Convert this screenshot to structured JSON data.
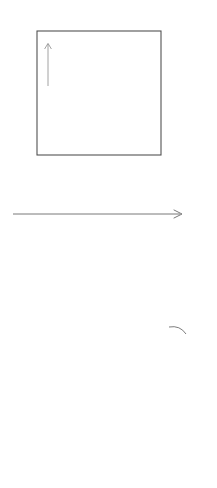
{
  "figure": {
    "title_visible": false,
    "background_color": "#ffffff",
    "ink_color": "#555555",
    "guide_color": "#d8d8d8",
    "curve_color": "#4a4a4a",
    "cobweb_color": "#777777"
  },
  "labels": {
    "identity_top": "id",
    "identity_bottom": "id",
    "function_top": "f",
    "function_bottom_base": "f",
    "function_bottom_exponent": "2"
  },
  "axis": {
    "name": "x-axis",
    "arrow": "right-arrow",
    "ticks": [
      {
        "id": "a0",
        "base": "a",
        "sub": "0",
        "x": 37,
        "label_x": 33,
        "label_y": 219
      },
      {
        "id": "x4",
        "base": "x",
        "sub": "4",
        "x": 76,
        "label_x": 69,
        "label_y": 232
      },
      {
        "id": "x2",
        "base": "x",
        "sub": "2",
        "x": 85,
        "label_x": 79,
        "label_y": 226
      },
      {
        "id": "x0",
        "base": "x",
        "sub": "0",
        "x": 93,
        "label_x": 88,
        "label_y": 219
      },
      {
        "id": "x1",
        "base": "x",
        "sub": "1",
        "x": 124,
        "label_x": 118,
        "label_y": 232
      },
      {
        "id": "x3",
        "base": "x",
        "sub": "3",
        "x": 131,
        "label_x": 126,
        "label_y": 226
      },
      {
        "id": "x5",
        "base": "x",
        "sub": "5",
        "x": 140,
        "label_x": 135,
        "label_y": 219
      },
      {
        "id": "a1",
        "base": "a",
        "sub": "1",
        "x": 161,
        "label_x": 155,
        "label_y": 219
      }
    ]
  },
  "chart_data": {
    "type": "line",
    "panels": [
      {
        "name": "top-panel-f",
        "description": "Graph of orientation-reversing map f with identity diagonal and inward spiralling cobweb inside the invariant box [a0,a1]x[a0,a1]",
        "xlabel": "",
        "ylabel": "",
        "box": {
          "x0": 37,
          "y0": 31,
          "x1": 161,
          "y1": 155
        },
        "legend": [
          "id",
          "f"
        ],
        "curves": [
          {
            "name": "identity",
            "style": "dashed",
            "points": [
              [
                22,
                170
              ],
              [
                176,
                16
              ]
            ]
          },
          {
            "name": "f",
            "style": "solid",
            "points": [
              [
                33,
                28
              ],
              [
                45,
                35
              ],
              [
                57,
                44
              ],
              [
                69,
                54
              ],
              [
                81,
                65
              ],
              [
                93,
                78
              ],
              [
                105,
                92
              ],
              [
                117,
                107
              ],
              [
                129,
                123
              ],
              [
                141,
                140
              ],
              [
                153,
                158
              ],
              [
                165,
                177
              ],
              [
                174,
                192
              ]
            ]
          }
        ],
        "cobweb": {
          "name": "spiral-cobweb",
          "start_x": 93,
          "vertices": [
            [
              37,
              31
            ],
            [
              161,
              31
            ],
            [
              161,
              155
            ],
            [
              37,
              155
            ],
            [
              41,
              151
            ],
            [
              157,
              151
            ],
            [
              157,
              35
            ],
            [
              41,
              35
            ],
            [
              45,
              39
            ],
            [
              153,
              39
            ],
            [
              153,
              147
            ],
            [
              45,
              147
            ],
            [
              50,
              142
            ],
            [
              148,
              142
            ],
            [
              148,
              44
            ],
            [
              50,
              44
            ],
            [
              55,
              49
            ],
            [
              143,
              49
            ],
            [
              143,
              137
            ],
            [
              55,
              137
            ],
            [
              61,
              131
            ],
            [
              137,
              131
            ],
            [
              137,
              55
            ],
            [
              61,
              55
            ],
            [
              67,
              61
            ],
            [
              131,
              61
            ],
            [
              131,
              125
            ],
            [
              67,
              125
            ],
            [
              73,
              119
            ],
            [
              125,
              119
            ],
            [
              125,
              67
            ],
            [
              73,
              67
            ],
            [
              79,
              73
            ],
            [
              119,
              73
            ],
            [
              119,
              113
            ],
            [
              79,
              113
            ],
            [
              85,
              107
            ],
            [
              113,
              107
            ],
            [
              113,
              79
            ],
            [
              85,
              79
            ],
            [
              90,
              84
            ],
            [
              108,
              84
            ],
            [
              108,
              102
            ],
            [
              90,
              102
            ],
            [
              94,
              98
            ],
            [
              104,
              98
            ],
            [
              104,
              88
            ],
            [
              94,
              88
            ]
          ]
        },
        "annotations": [
          {
            "name": "up-arrow",
            "x": 48,
            "y_from": 86,
            "y_to": 44
          }
        ]
      },
      {
        "name": "bottom-panel-f-squared",
        "description": "Graph of f squared, increasing with three fixed points, identity diagonal and staircase cobweb converging to the middle fixed point",
        "xlabel": "",
        "ylabel": "",
        "legend": [
          "id",
          "f^2"
        ],
        "curves": [
          {
            "name": "identity",
            "style": "dashed",
            "points": [
              [
                14,
                476
              ],
              [
                200,
                290
              ]
            ]
          },
          {
            "name": "f-squared",
            "style": "solid",
            "points": [
              [
                22,
                470
              ],
              [
                30,
                462
              ],
              [
                38,
                455
              ],
              [
                46,
                449
              ],
              [
                54,
                444
              ],
              [
                62,
                440
              ],
              [
                70,
                436
              ],
              [
                78,
                431
              ],
              [
                86,
                425
              ],
              [
                94,
                418
              ],
              [
                102,
                409
              ],
              [
                110,
                399
              ],
              [
                118,
                387
              ],
              [
                126,
                375
              ],
              [
                134,
                363
              ],
              [
                142,
                352
              ],
              [
                150,
                343
              ],
              [
                156,
                337
              ],
              [
                162,
                332
              ],
              [
                168,
                329
              ],
              [
                174,
                328
              ],
              [
                180,
                329
              ],
              [
                186,
                332
              ]
            ]
          }
        ],
        "cobweb": {
          "name": "staircase-cobweb",
          "vertices": [
            [
              37,
              464
            ],
            [
              37,
              459
            ],
            [
              47,
              459
            ],
            [
              47,
              452
            ],
            [
              58,
              452
            ],
            [
              58,
              445
            ],
            [
              69,
              445
            ],
            [
              69,
              438
            ],
            [
              80,
              438
            ],
            [
              80,
              430
            ],
            [
              91,
              430
            ],
            [
              91,
              420
            ],
            [
              101,
              420
            ],
            [
              101,
              409
            ],
            [
              110,
              409
            ],
            [
              110,
              398
            ],
            [
              119,
              398
            ],
            [
              119,
              387
            ],
            [
              127,
              387
            ],
            [
              127,
              377
            ],
            [
              134,
              377
            ],
            [
              134,
              368
            ],
            [
              140,
              368
            ],
            [
              140,
              360
            ],
            [
              145,
              360
            ],
            [
              145,
              353
            ],
            [
              150,
              353
            ],
            [
              150,
              348
            ],
            [
              154,
              348
            ],
            [
              154,
              344
            ],
            [
              157,
              344
            ],
            [
              157,
              341
            ]
          ]
        },
        "annotations": [
          {
            "name": "f-squared-leader-arc",
            "from": [
              186,
              331
            ],
            "to": [
              171,
              327
            ]
          }
        ]
      }
    ],
    "droplines": {
      "name": "vertical-guide-lines",
      "color": "#d8d8d8",
      "y_top": 31,
      "y_bottom": 488,
      "x_values": [
        37,
        76,
        85,
        93,
        124,
        131,
        140,
        148,
        161
      ]
    },
    "grid": false,
    "legend_position": "inline-right"
  }
}
